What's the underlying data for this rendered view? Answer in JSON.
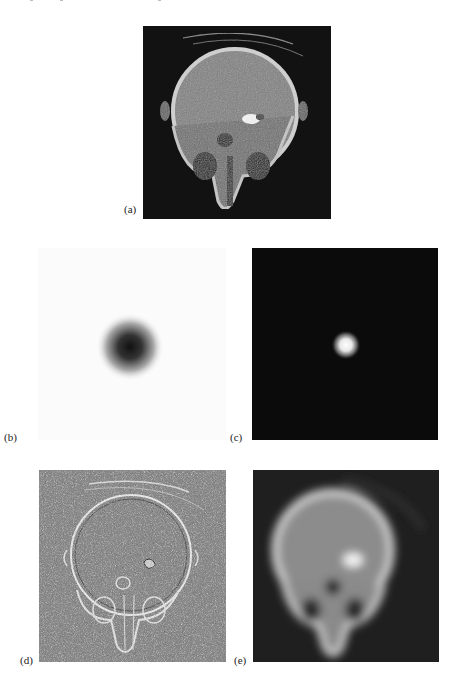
{
  "figure": {
    "panels": [
      {
        "id": "a",
        "label": "(a)",
        "description": "Noisy CT slice of skull (original degraded image)",
        "background": "#0e0e0e"
      },
      {
        "id": "b",
        "label": "(b)",
        "description": "Gaussian point spread function shown inverted (dark blob on white)",
        "background": "#fbfbfb"
      },
      {
        "id": "c",
        "label": "(c)",
        "description": "Gaussian point spread function (bright spot on black)",
        "background": "#0a0a0a"
      },
      {
        "id": "d",
        "label": "(d)",
        "description": "Edge-enhanced / high-pass result on gray background",
        "background": "#8a8a8a"
      },
      {
        "id": "e",
        "label": "(e)",
        "description": "Blurred (low-pass filtered) CT skull image",
        "background": "#1e1e1e"
      }
    ]
  }
}
